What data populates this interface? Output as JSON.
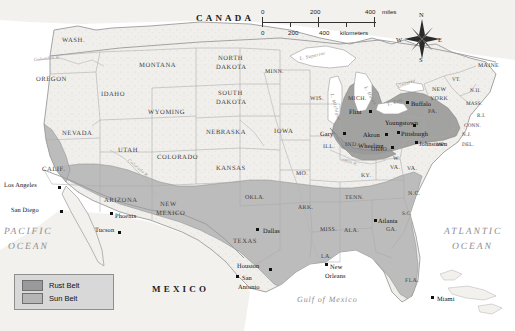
{
  "map": {
    "title": "Rust Belt and Sun Belt Regions of the United States",
    "colors": {
      "rust_belt": "#999999",
      "sun_belt": "#b5b5b5",
      "land": "#f0efec",
      "water": "#ffffff",
      "border": "#9a9a9a",
      "legend_bg": "#d8d8d8"
    },
    "countries": [
      {
        "name": "CANADA",
        "x": 196,
        "y": 14
      },
      {
        "name": "MEXICO",
        "x": 152,
        "y": 285
      }
    ],
    "oceans": [
      {
        "name": "PACIFIC",
        "x": 4,
        "y": 228
      },
      {
        "name": "OCEAN",
        "x": 8,
        "y": 243
      },
      {
        "name": "ATLANTIC",
        "x": 444,
        "y": 228
      },
      {
        "name": "OCEAN",
        "x": 452,
        "y": 243
      }
    ],
    "gulf": {
      "name": "Gulf of Mexico",
      "x": 297,
      "y": 296
    },
    "lakes": [
      {
        "name": "L. Superior",
        "x": 300,
        "y": 58,
        "rot": -12
      },
      {
        "name": "L. Michigan",
        "x": 330,
        "y": 92,
        "rot": 74
      },
      {
        "name": "L. Huron",
        "x": 364,
        "y": 85,
        "rot": 62
      },
      {
        "name": "L. Erie",
        "x": 388,
        "y": 104,
        "rot": -18
      },
      {
        "name": "Ontario",
        "x": 399,
        "y": 86,
        "rot": -22
      }
    ],
    "rivers": [
      {
        "name": "Columbia R.",
        "x": 34,
        "y": 58,
        "rot": -6
      },
      {
        "name": "Colorado R.",
        "x": 128,
        "y": 158,
        "rot": 40
      },
      {
        "name": "Ohio R.",
        "x": 342,
        "y": 158,
        "rot": 18
      }
    ],
    "states": [
      {
        "name": "WASH.",
        "x": 62,
        "y": 38,
        "cls": "state"
      },
      {
        "name": "OREGON",
        "x": 36,
        "y": 77,
        "cls": "state"
      },
      {
        "name": "IDAHO",
        "x": 101,
        "y": 92,
        "cls": "state"
      },
      {
        "name": "MONTANA",
        "x": 139,
        "y": 63,
        "cls": "state"
      },
      {
        "name": "WYOMING",
        "x": 148,
        "y": 110,
        "cls": "state"
      },
      {
        "name": "NEVADA",
        "x": 62,
        "y": 131,
        "cls": "state"
      },
      {
        "name": "UTAH",
        "x": 118,
        "y": 148,
        "cls": "state"
      },
      {
        "name": "COLORADO",
        "x": 157,
        "y": 155,
        "cls": "state"
      },
      {
        "name": "CALIF.",
        "x": 42,
        "y": 167,
        "cls": "state"
      },
      {
        "name": "ARIZONA",
        "x": 104,
        "y": 198,
        "cls": "state"
      },
      {
        "name": "NEW",
        "x": 160,
        "y": 202,
        "cls": "state"
      },
      {
        "name": "MEXICO",
        "x": 156,
        "y": 211,
        "cls": "state"
      },
      {
        "name": "NORTH",
        "x": 218,
        "y": 56,
        "cls": "state"
      },
      {
        "name": "DAKOTA",
        "x": 216,
        "y": 65,
        "cls": "state"
      },
      {
        "name": "SOUTH",
        "x": 218,
        "y": 91,
        "cls": "state"
      },
      {
        "name": "DAKOTA",
        "x": 216,
        "y": 100,
        "cls": "state"
      },
      {
        "name": "NEBRASKA",
        "x": 206,
        "y": 130,
        "cls": "state"
      },
      {
        "name": "KANSAS",
        "x": 216,
        "y": 166,
        "cls": "state"
      },
      {
        "name": "OKLA.",
        "x": 245,
        "y": 196,
        "cls": "state sm"
      },
      {
        "name": "TEXAS",
        "x": 233,
        "y": 239,
        "cls": "state"
      },
      {
        "name": "MINN.",
        "x": 265,
        "y": 70,
        "cls": "state sm"
      },
      {
        "name": "IOWA",
        "x": 274,
        "y": 129,
        "cls": "state"
      },
      {
        "name": "MO.",
        "x": 296,
        "y": 172,
        "cls": "state sm"
      },
      {
        "name": "ARK.",
        "x": 298,
        "y": 206,
        "cls": "state sm"
      },
      {
        "name": "LA.",
        "x": 321,
        "y": 255,
        "cls": "state sm"
      },
      {
        "name": "WIS.",
        "x": 310,
        "y": 97,
        "cls": "state sm"
      },
      {
        "name": "ILL.",
        "x": 323,
        "y": 145,
        "cls": "state sm"
      },
      {
        "name": "IND.",
        "x": 345,
        "y": 143,
        "cls": "state sm"
      },
      {
        "name": "MICH.",
        "x": 348,
        "y": 97,
        "cls": "state sm"
      },
      {
        "name": "OHIO",
        "x": 371,
        "y": 148,
        "cls": "state sm"
      },
      {
        "name": "KY.",
        "x": 361,
        "y": 174,
        "cls": "state sm"
      },
      {
        "name": "TENN.",
        "x": 345,
        "y": 196,
        "cls": "state sm"
      },
      {
        "name": "MISS.",
        "x": 320,
        "y": 228,
        "cls": "state sm"
      },
      {
        "name": "ALA.",
        "x": 344,
        "y": 229,
        "cls": "state sm"
      },
      {
        "name": "GA.",
        "x": 386,
        "y": 228,
        "cls": "state sm"
      },
      {
        "name": "FLA.",
        "x": 405,
        "y": 279,
        "cls": "state sm"
      },
      {
        "name": "S.C.",
        "x": 402,
        "y": 212,
        "cls": "state tiny"
      },
      {
        "name": "N.C.",
        "x": 408,
        "y": 192,
        "cls": "state sm"
      },
      {
        "name": "VA.",
        "x": 407,
        "y": 167,
        "cls": "state sm"
      },
      {
        "name": "W.",
        "x": 393,
        "y": 157,
        "cls": "state sm"
      },
      {
        "name": "VA.",
        "x": 390,
        "y": 166,
        "cls": "state sm"
      },
      {
        "name": "PA.",
        "x": 428,
        "y": 110,
        "cls": "state sm"
      },
      {
        "name": "NEW",
        "x": 432,
        "y": 88,
        "cls": "state sm"
      },
      {
        "name": "YORK",
        "x": 430,
        "y": 97,
        "cls": "state sm"
      },
      {
        "name": "MD.",
        "x": 436,
        "y": 143,
        "cls": "state tiny"
      },
      {
        "name": "DEL.",
        "x": 462,
        "y": 143,
        "cls": "state tiny"
      },
      {
        "name": "N.J.",
        "x": 462,
        "y": 133,
        "cls": "state tiny"
      },
      {
        "name": "CONN.",
        "x": 464,
        "y": 124,
        "cls": "state tiny"
      },
      {
        "name": "R.I.",
        "x": 477,
        "y": 114,
        "cls": "state tiny"
      },
      {
        "name": "MASS.",
        "x": 466,
        "y": 102,
        "cls": "state tiny"
      },
      {
        "name": "N.H.",
        "x": 470,
        "y": 89,
        "cls": "state tiny"
      },
      {
        "name": "VT.",
        "x": 452,
        "y": 78,
        "cls": "state tiny"
      },
      {
        "name": "MAINE",
        "x": 478,
        "y": 64,
        "cls": "state sm"
      }
    ],
    "cities": [
      {
        "name": "Los Angeles",
        "lx": 4,
        "ly": 183,
        "dx": 58,
        "dy": 186,
        "align": "right"
      },
      {
        "name": "San Diego",
        "lx": 11,
        "ly": 208,
        "dx": 60,
        "dy": 210,
        "align": "right"
      },
      {
        "name": "Phoenix",
        "lx": 115,
        "ly": 214,
        "dx": 110,
        "dy": 212,
        "align": "left"
      },
      {
        "name": "Tucson",
        "lx": 95,
        "ly": 228,
        "dx": 118,
        "dy": 231,
        "align": "left"
      },
      {
        "name": "Dallas",
        "lx": 263,
        "ly": 229,
        "dx": 256,
        "dy": 228,
        "align": "left"
      },
      {
        "name": "Houston",
        "lx": 237,
        "ly": 264,
        "dx": 269,
        "dy": 268,
        "align": "left"
      },
      {
        "name": "San",
        "lx": 242,
        "ly": 276,
        "dx": 236,
        "dy": 275,
        "align": "left"
      },
      {
        "name": "Antonio",
        "lx": 238,
        "ly": 285,
        "dx": -99,
        "dy": -99,
        "align": "left"
      },
      {
        "name": "New",
        "lx": 330,
        "ly": 265,
        "dx": 325,
        "dy": 263,
        "align": "left"
      },
      {
        "name": "Orleans",
        "lx": 325,
        "ly": 274,
        "dx": -99,
        "dy": -99,
        "align": "left"
      },
      {
        "name": "Miami",
        "lx": 437,
        "ly": 297,
        "dx": 431,
        "dy": 296,
        "align": "left"
      },
      {
        "name": "Atlanta",
        "lx": 378,
        "ly": 219,
        "dx": 374,
        "dy": 219,
        "align": "left"
      },
      {
        "name": "Gary",
        "lx": 320,
        "ly": 132,
        "dx": 343,
        "dy": 132,
        "align": "left"
      },
      {
        "name": "Flint",
        "lx": 349,
        "ly": 110,
        "dx": 369,
        "dy": 110,
        "align": "left"
      },
      {
        "name": "Akron",
        "lx": 363,
        "ly": 133,
        "dx": 385,
        "dy": 133,
        "align": "left"
      },
      {
        "name": "Wheeling",
        "lx": 358,
        "ly": 144,
        "dx": 391,
        "dy": 146,
        "align": "left"
      },
      {
        "name": "Buffalo",
        "lx": 411,
        "ly": 102,
        "dx": 406,
        "dy": 101,
        "align": "left"
      },
      {
        "name": "Youngstown",
        "lx": 385,
        "ly": 121,
        "dx": 413,
        "dy": 124,
        "align": "left"
      },
      {
        "name": "Pittsburgh",
        "lx": 401,
        "ly": 132,
        "dx": 397,
        "dy": 131,
        "align": "left"
      },
      {
        "name": "Johnstown",
        "lx": 419,
        "ly": 142,
        "dx": 415,
        "dy": 141,
        "align": "left"
      }
    ],
    "scale": {
      "miles_ticks": [
        "0",
        "200",
        "400"
      ],
      "miles_unit": "miles",
      "km_ticks": [
        "0",
        "200",
        "400"
      ],
      "km_unit": "kilometers"
    },
    "compass": {
      "n": "N",
      "e": "E",
      "s": "S",
      "w": "W"
    },
    "legend": {
      "items": [
        {
          "label": "Rust Belt",
          "color": "#999999"
        },
        {
          "label": "Sun Belt",
          "color": "#b5b5b5"
        }
      ]
    }
  }
}
